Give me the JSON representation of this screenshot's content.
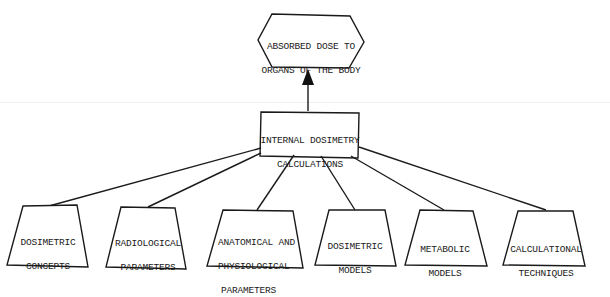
{
  "diagram": {
    "type": "flow",
    "colors": {
      "stroke": "#1a1a1a",
      "fill": "#ffffff",
      "background": "#ffffff"
    },
    "top_node": {
      "id": "absorbed-dose",
      "shape": "hexagon",
      "line1": "ABSORBED DOSE TO",
      "line2": "ORGANS OF THE BODY"
    },
    "center_node": {
      "id": "internal-dosimetry",
      "shape": "rectangle",
      "line1": "INTERNAL DOSIMETRY",
      "line2": "CALCULATIONS"
    },
    "edges": [
      {
        "from": "internal-dosimetry",
        "to": "absorbed-dose",
        "arrow": true
      },
      {
        "from": "dosimetric-concepts",
        "to": "internal-dosimetry",
        "arrow": false
      },
      {
        "from": "radiological-parameters",
        "to": "internal-dosimetry",
        "arrow": false
      },
      {
        "from": "anatomical-physiological",
        "to": "internal-dosimetry",
        "arrow": false
      },
      {
        "from": "dosimetric-models",
        "to": "internal-dosimetry",
        "arrow": false
      },
      {
        "from": "metabolic-models",
        "to": "internal-dosimetry",
        "arrow": false
      },
      {
        "from": "calculational-techniques",
        "to": "internal-dosimetry",
        "arrow": false
      }
    ],
    "input_nodes": [
      {
        "id": "dosimetric-concepts",
        "shape": "trapezoid",
        "lines": [
          "DOSIMETRIC",
          "CONCEPTS"
        ]
      },
      {
        "id": "radiological-parameters",
        "shape": "trapezoid",
        "lines": [
          "RADIOLOGICAL",
          "PARAMETERS"
        ]
      },
      {
        "id": "anatomical-physiological",
        "shape": "trapezoid",
        "lines": [
          "ANATOMICAL AND",
          "PHYSIOLOGICAL",
          "PARAMETERS"
        ]
      },
      {
        "id": "dosimetric-models",
        "shape": "trapezoid",
        "lines": [
          "DOSIMETRIC",
          "MODELS"
        ]
      },
      {
        "id": "metabolic-models",
        "shape": "trapezoid",
        "lines": [
          "METABOLIC",
          "MODELS"
        ]
      },
      {
        "id": "calculational-techniques",
        "shape": "trapezoid",
        "lines": [
          "CALCULATIONAL",
          "TECHNIQUES"
        ]
      }
    ]
  }
}
